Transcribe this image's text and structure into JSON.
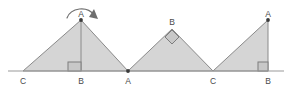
{
  "figure": {
    "canvas": {
      "width": 291,
      "height": 92
    },
    "colors": {
      "fill": "#d5d5d5",
      "stroke": "#8a8a8a",
      "baseline": "#9a9a9a",
      "label": "#4a4a4a",
      "marker_fill": "#c8c8c8",
      "arrow": "#6f6f6f",
      "background": "#ffffff"
    },
    "baseline": {
      "x1": 8,
      "x2": 284,
      "y": 71
    },
    "triangles": [
      {
        "name": "triangle-left",
        "points": "23,71 81,20 128,71",
        "apex_label": "A",
        "left_label": "C",
        "right_label": "B"
      },
      {
        "name": "triangle-middle",
        "points": "128,71 172,29 213,71",
        "apex_label": "B",
        "left_label": "A",
        "right_label": "C"
      },
      {
        "name": "triangle-right",
        "points": "213,71 268,20 268,71",
        "apex_label": "A",
        "left_label": "C",
        "right_label": "B"
      }
    ],
    "labels": [
      {
        "id": "label-apex-a-left",
        "text": "A",
        "x": 81,
        "y": 17
      },
      {
        "id": "label-c-left",
        "text": "C",
        "x": 23,
        "y": 84
      },
      {
        "id": "label-b-left",
        "text": "B",
        "x": 81,
        "y": 84
      },
      {
        "id": "label-apex-b-middle",
        "text": "B",
        "x": 172,
        "y": 25
      },
      {
        "id": "label-a-middle",
        "text": "A",
        "x": 128,
        "y": 84
      },
      {
        "id": "label-c-middle",
        "text": "C",
        "x": 213,
        "y": 84
      },
      {
        "id": "label-apex-a-right",
        "text": "A",
        "x": 268,
        "y": 17
      },
      {
        "id": "label-b-right",
        "text": "B",
        "x": 268,
        "y": 84
      }
    ],
    "right_angle_markers": [
      {
        "id": "right-angle-b-left",
        "type": "square",
        "x": 68,
        "y": 62,
        "size": 9
      },
      {
        "id": "right-angle-b-middle",
        "type": "diamond",
        "x": 172,
        "y": 35,
        "size": 9
      },
      {
        "id": "right-angle-b-right",
        "type": "square",
        "x": 259,
        "y": 62,
        "size": 9
      }
    ],
    "altitudes": [
      {
        "id": "altitude-left",
        "x": 81,
        "y1": 20,
        "y2": 71
      }
    ],
    "vertex_dots": [
      {
        "id": "dot-apex-a-left",
        "x": 81,
        "y": 20
      },
      {
        "id": "dot-a-middle",
        "x": 128,
        "y": 71
      },
      {
        "id": "dot-apex-a-right",
        "x": 268,
        "y": 20
      }
    ],
    "rotation_arrow": {
      "id": "rotation-arc-arrow",
      "description": "clockwise curved arrow above apex A",
      "path": "M 67,18 A 15 13 0 0 1 94,15",
      "head": "94,9 98,19 89,17"
    }
  }
}
